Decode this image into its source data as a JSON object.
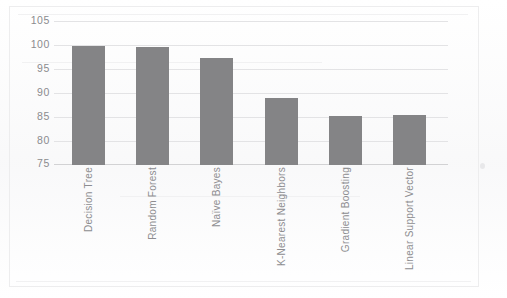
{
  "chart_data": {
    "type": "bar",
    "title": "",
    "subtitle": "",
    "xlabel": "",
    "ylabel": "",
    "categories": [
      "Decision Tree",
      "Random Forest",
      "Naïve Bayes",
      "K-Nearest Neighbors",
      "Gradient Boosting",
      "Linear Support Vector"
    ],
    "values": [
      99.9,
      99.7,
      97.4,
      89.0,
      85.2,
      85.4
    ],
    "ylim": [
      75,
      105
    ],
    "ytick_values": [
      105,
      100,
      95,
      90,
      85,
      80,
      75
    ],
    "ytick_labels": [
      "105",
      "100",
      "95",
      "90",
      "85",
      "80",
      "75"
    ],
    "grid": true,
    "grid_axis": "y",
    "legend": false,
    "legend_position": "none",
    "bar_color": "#848486",
    "gridline_color": "#e3e3e5",
    "axis_label_color": "#8b8b8e",
    "x_tick_rotation": -90,
    "background_color": "#ffffff"
  },
  "axes": {
    "y": {
      "ticks": [
        {
          "label": "105",
          "value": 105
        },
        {
          "label": "100",
          "value": 100
        },
        {
          "label": "95",
          "value": 95
        },
        {
          "label": "90",
          "value": 90
        },
        {
          "label": "85",
          "value": 85
        },
        {
          "label": "80",
          "value": 80
        },
        {
          "label": "75",
          "value": 75
        }
      ]
    },
    "x": {
      "ticks": [
        {
          "label": "Decision Tree"
        },
        {
          "label": "Random Forest"
        },
        {
          "label": "Naïve Bayes"
        },
        {
          "label": "K-Nearest Neighbors"
        },
        {
          "label": "Gradient Boosting"
        },
        {
          "label": "Linear Support Vector"
        }
      ]
    }
  }
}
